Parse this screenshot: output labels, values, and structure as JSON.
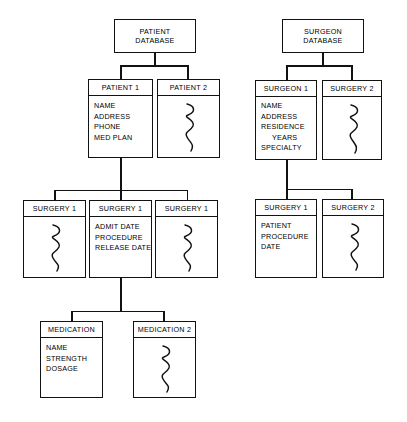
{
  "diagram": {
    "type": "tree-diagram",
    "line_color": "#121212",
    "background_color": "#ffffff"
  },
  "nodes": {
    "patient_database": {
      "title": "PATIENT\nDATABASE"
    },
    "patient_1": {
      "title": "PATIENT 1",
      "fields": [
        "NAME",
        "ADDRESS",
        "PHONE",
        "MED PLAN"
      ]
    },
    "patient_2": {
      "title": "PATIENT 2",
      "body": "squiggle"
    },
    "surgery_left_1": {
      "title": "SURGERY 1",
      "body": "squiggle"
    },
    "surgery_left_2": {
      "title": "SURGERY 1",
      "fields": [
        "ADMIT DATE",
        "PROCEDURE",
        "RELEASE DATE"
      ]
    },
    "surgery_left_3": {
      "title": "SURGERY 1",
      "body": "squiggle"
    },
    "medication_1": {
      "title": "MEDICATION",
      "fields": [
        "NAME",
        "STRENGTH",
        "DOSAGE"
      ]
    },
    "medication_2": {
      "title": "MEDICATION 2",
      "body": "squiggle"
    },
    "surgeon_database": {
      "title": "SURGEON\nDATABASE"
    },
    "surgeon_1": {
      "title": "SURGEON 1",
      "fields": [
        "NAME",
        "ADDRESS",
        "RESIDENCE",
        "YEARS",
        "SPECIALTY"
      ],
      "indented_fields": [
        "YEARS"
      ]
    },
    "surgery_right_top": {
      "title": "SURGERY 2",
      "body": "squiggle"
    },
    "surgery_right_1": {
      "title": "SURGERY 1",
      "fields": [
        "PATIENT",
        "PROCEDURE",
        "DATE"
      ]
    },
    "surgery_right_2": {
      "title": "SURGERY 2",
      "body": "squiggle"
    }
  }
}
